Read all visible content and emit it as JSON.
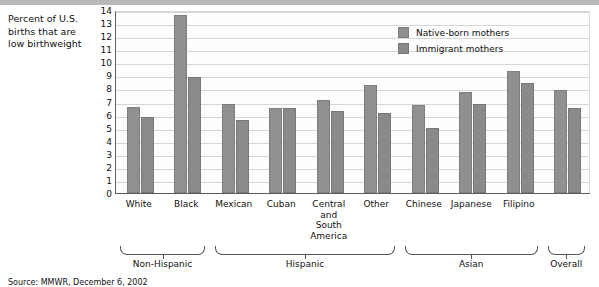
{
  "caption": {
    "text": "Percent of U.S. births that are low birthweight"
  },
  "source": {
    "text": "Source: MMWR, December 6, 2002"
  },
  "legend": {
    "position": "top-right",
    "entries": [
      {
        "label": "Native-born mothers",
        "color": "#909090"
      },
      {
        "label": "Immigrant mothers",
        "color": "#8a8a8a"
      }
    ]
  },
  "groups": [
    {
      "label": "Non-Hispanic",
      "span": 2
    },
    {
      "label": "Hispanic",
      "span": 4
    },
    {
      "label": "Asian",
      "span": 3
    },
    {
      "label": "Overall",
      "span": 1
    }
  ],
  "yticks": [
    "14",
    "13",
    "12",
    "11",
    "10",
    "9",
    "8",
    "7",
    "6",
    "5",
    "4",
    "3",
    "2",
    "1",
    "0"
  ],
  "chart_data": {
    "type": "bar",
    "title": "",
    "xlabel": "",
    "ylabel": "Percent of U.S. births that are low birthweight",
    "ylim": [
      0,
      14
    ],
    "ytick_step": 1,
    "grid": true,
    "legend_position": "top-right",
    "categories": [
      "White",
      "Black",
      "Mexican",
      "Cuban",
      "Central and South America",
      "Other",
      "Chinese",
      "Japanese",
      "Filipino",
      "Overall"
    ],
    "category_labels_display": [
      "White",
      "Black",
      "Mexican",
      "Cuban",
      "Central\nand\nSouth\nAmerica",
      "Other",
      "Chinese",
      "Japanese",
      "Filipino",
      ""
    ],
    "series": [
      {
        "name": "Native-born mothers",
        "color": "#909090",
        "values": [
          6.6,
          13.6,
          6.8,
          6.5,
          7.1,
          8.3,
          6.7,
          7.7,
          9.3,
          7.9
        ]
      },
      {
        "name": "Immigrant mothers",
        "color": "#8a8a8a",
        "values": [
          5.8,
          8.9,
          5.6,
          6.5,
          6.3,
          6.1,
          5.0,
          6.8,
          8.4,
          6.5
        ]
      }
    ],
    "group_brackets": [
      {
        "label": "Non-Hispanic",
        "categories": [
          "White",
          "Black"
        ]
      },
      {
        "label": "Hispanic",
        "categories": [
          "Mexican",
          "Cuban",
          "Central and South America",
          "Other"
        ]
      },
      {
        "label": "Asian",
        "categories": [
          "Chinese",
          "Japanese",
          "Filipino"
        ]
      },
      {
        "label": "Overall",
        "categories": [
          "Overall"
        ]
      }
    ]
  }
}
